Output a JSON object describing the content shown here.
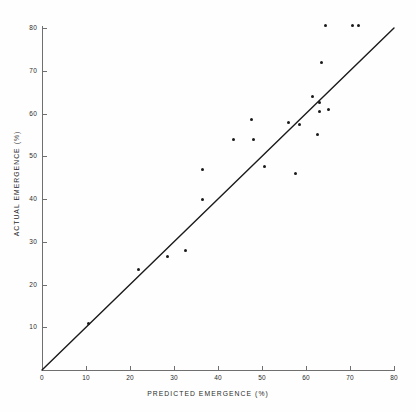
{
  "chart_data": {
    "type": "scatter",
    "title": "",
    "xlabel": "PREDICTED EMERGENCE (%)",
    "ylabel": "ACTUAL EMERGENCE (%)",
    "xlim": [
      0,
      80
    ],
    "ylim": [
      0,
      80
    ],
    "xticks": [
      0,
      10,
      20,
      30,
      40,
      50,
      60,
      70,
      80
    ],
    "yticks": [
      10,
      20,
      30,
      40,
      50,
      60,
      70,
      80
    ],
    "xtick_labels": [
      "0",
      "10",
      "20",
      "30",
      "40",
      "50",
      "60",
      "70",
      "80"
    ],
    "ytick_labels": [
      "10",
      "20",
      "30",
      "40",
      "50",
      "60",
      "70",
      "80"
    ],
    "grid": false,
    "legend": null,
    "marker_color": "#1a1a1a",
    "line_color": "#1a1a1a",
    "axis_color": "#6f6f6f",
    "reference_line": {
      "name": "1:1 identity line",
      "x": [
        0,
        80
      ],
      "y": [
        0,
        80
      ]
    },
    "points": [
      {
        "x": 10.5,
        "y": 11.0
      },
      {
        "x": 22.0,
        "y": 23.5
      },
      {
        "x": 28.5,
        "y": 26.5
      },
      {
        "x": 32.5,
        "y": 28.0
      },
      {
        "x": 36.5,
        "y": 40.0
      },
      {
        "x": 36.5,
        "y": 47.0
      },
      {
        "x": 43.5,
        "y": 54.0
      },
      {
        "x": 47.5,
        "y": 58.5
      },
      {
        "x": 48.0,
        "y": 54.0
      },
      {
        "x": 50.5,
        "y": 47.5
      },
      {
        "x": 56.0,
        "y": 58.0
      },
      {
        "x": 57.5,
        "y": 46.0
      },
      {
        "x": 58.5,
        "y": 57.5
      },
      {
        "x": 61.5,
        "y": 64.0
      },
      {
        "x": 62.5,
        "y": 55.0
      },
      {
        "x": 63.0,
        "y": 60.5
      },
      {
        "x": 63.0,
        "y": 62.5
      },
      {
        "x": 63.5,
        "y": 72.0
      },
      {
        "x": 64.5,
        "y": 80.5
      },
      {
        "x": 65.0,
        "y": 61.0
      },
      {
        "x": 70.5,
        "y": 80.5
      },
      {
        "x": 72.0,
        "y": 80.5
      }
    ]
  },
  "axes": {
    "x_title": "PREDICTED EMERGENCE (%)",
    "y_title": "ACTUAL EMERGENCE (%)"
  }
}
